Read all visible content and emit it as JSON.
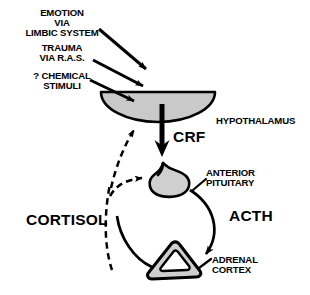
{
  "figure": {
    "colors": {
      "stroke": "#000000",
      "organ_fill": "#cfcfcf",
      "hypothalamus_fill": "#c9c9c9",
      "background": "#ffffff",
      "inner_fill": "#ffffff"
    }
  },
  "stimuli": [
    {
      "id": "emotion",
      "text": "EMOTION\nVIA\nLIMBIC SYSTEM"
    },
    {
      "id": "trauma",
      "text": "TRAUMA\nVIA R.A.S."
    },
    {
      "id": "chemical",
      "text": "? CHEMICAL\nSTIMULI"
    }
  ],
  "organs": [
    {
      "id": "hypothalamus",
      "label": "HYPOTHALAMUS"
    },
    {
      "id": "anterior-pituitary",
      "label": "ANTERIOR\nPITUITARY"
    },
    {
      "id": "adrenal-cortex",
      "label": "ADRENAL\nCORTEX"
    }
  ],
  "hormones": [
    {
      "id": "crf",
      "label": "CRF"
    },
    {
      "id": "acth",
      "label": "ACTH"
    },
    {
      "id": "cortisol",
      "label": "CORTISOL"
    }
  ]
}
